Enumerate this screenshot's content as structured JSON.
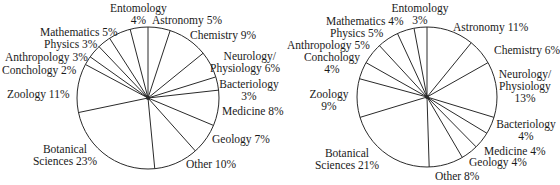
{
  "chart_data": [
    {
      "type": "pie",
      "title": "",
      "start_angle": "12 o'clock, clockwise",
      "categories": [
        "Astronomy",
        "Chemistry",
        "Neurology/Physiology",
        "Bacteriology",
        "Medicine",
        "Geology",
        "Other",
        "Botanical Sciences",
        "Zoology",
        "Conchology",
        "Anthropology",
        "Physics",
        "Mathematics",
        "Entomology"
      ],
      "values": [
        5,
        9,
        6,
        3,
        8,
        7,
        10,
        23,
        11,
        2,
        3,
        3,
        5,
        4
      ],
      "unit": "%"
    },
    {
      "type": "pie",
      "title": "",
      "start_angle": "12 o'clock, clockwise",
      "categories": [
        "Astronomy",
        "Chemistry",
        "Neurology/Physiology",
        "Bacteriology",
        "Medicine",
        "Geology",
        "Other",
        "Botanical Sciences",
        "Zoology",
        "Conchology",
        "Anthropology",
        "Physics",
        "Mathematics",
        "Entomology"
      ],
      "values": [
        11,
        6,
        13,
        4,
        4,
        4,
        8,
        21,
        9,
        4,
        5,
        5,
        4,
        3
      ],
      "unit": "%"
    }
  ],
  "labels": {
    "left": {
      "entomology": "Entomology",
      "entomology_pct": "4%",
      "astronomy": "Astronomy  5%",
      "chemistry": "Chemistry  9%",
      "neurology_1": "Neurology/",
      "neurology_2": "Physiology  6%",
      "bacteriology_1": "Bacteriology",
      "bacteriology_2": "3%",
      "medicine": "Medicine  8%",
      "geology": "Geology  7%",
      "other": "Other  10%",
      "botanical_1": "Botanical",
      "botanical_2": "Sciences  23%",
      "zoology": "Zoology  11%",
      "conchology": "Conchology  2%",
      "anthropology": "Anthropology  3%",
      "physics": "Physics  3%",
      "mathematics": "Mathematics  5%"
    },
    "right": {
      "entomology": "Entomology",
      "entomology_pct": "3%",
      "astronomy": "Astronomy  11%",
      "chemistry": "Chemistry  6%",
      "neurology_1": "Neurology/",
      "neurology_2": "Physiology",
      "neurology_3": "13%",
      "bacteriology_1": "Bacteriology",
      "bacteriology_2": "4%",
      "medicine": "Medicine  4%",
      "geology": "Geology  4%",
      "other": "Other  8%",
      "botanical_1": "Botanical",
      "botanical_2": "Sciences  21%",
      "zoology_1": "Zoology",
      "zoology_2": "9%",
      "conchology_1": "Conchology",
      "conchology_2": "4%",
      "anthropology": "Anthropology  5%",
      "physics": "Physics  5%",
      "mathematics": "Mathematics  4%"
    }
  },
  "style": {
    "stroke": "#2a2a2a",
    "fill": "#ffffff"
  }
}
